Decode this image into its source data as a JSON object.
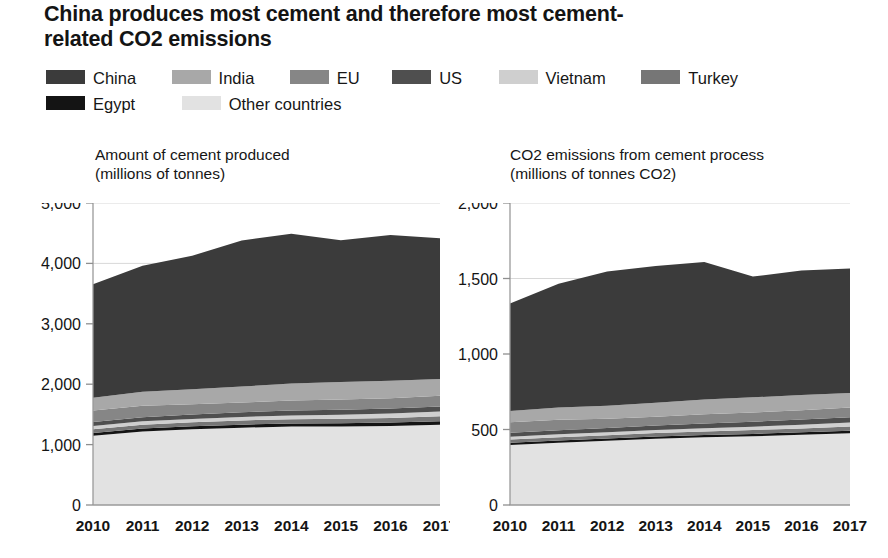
{
  "title": "China produces most cement and therefore most cement-related CO2 emissions",
  "legend": {
    "rows": [
      [
        {
          "label": "China",
          "color": "#3b3b3b"
        },
        {
          "label": "India",
          "color": "#a8a8a8"
        },
        {
          "label": "EU",
          "color": "#868686"
        },
        {
          "label": "US",
          "color": "#4f4f4f"
        },
        {
          "label": "Vietnam",
          "color": "#cfcfcf"
        },
        {
          "label": "Turkey",
          "color": "#767676"
        }
      ],
      [
        {
          "label": "Egypt",
          "color": "#141414"
        },
        {
          "label": "Other countries",
          "color": "#e2e2e2"
        }
      ]
    ]
  },
  "chart_data": [
    {
      "id": "cement-production",
      "type": "area",
      "stacked": true,
      "title": "Amount of cement produced\n(millions of tonnes)",
      "xlabel": "",
      "ylabel": "millions of tonnes",
      "x": [
        "2010",
        "2011",
        "2012",
        "2013",
        "2014",
        "2015",
        "2016",
        "2017"
      ],
      "xlim": [
        2010,
        2017
      ],
      "ylim": [
        0,
        5000
      ],
      "yticks": [
        0,
        1000,
        2000,
        3000,
        4000,
        5000
      ],
      "ytick_labels": [
        "0",
        "1,000",
        "2,000",
        "3,000",
        "4,000",
        "5,000"
      ],
      "grid": true,
      "series": [
        {
          "name": "Other countries",
          "color": "#e2e2e2",
          "values": [
            1145,
            1215,
            1255,
            1280,
            1300,
            1300,
            1310,
            1330
          ]
        },
        {
          "name": "Egypt",
          "color": "#141414",
          "values": [
            48,
            50,
            50,
            50,
            50,
            55,
            55,
            58
          ]
        },
        {
          "name": "Turkey",
          "color": "#767676",
          "values": [
            63,
            64,
            64,
            71,
            71,
            71,
            75,
            80
          ]
        },
        {
          "name": "Vietnam",
          "color": "#cfcfcf",
          "values": [
            51,
            56,
            56,
            58,
            61,
            68,
            73,
            78
          ]
        },
        {
          "name": "US",
          "color": "#4f4f4f",
          "values": [
            66,
            68,
            74,
            77,
            83,
            84,
            86,
            86
          ]
        },
        {
          "name": "EU",
          "color": "#868686",
          "values": [
            191,
            192,
            168,
            160,
            167,
            167,
            170,
            176
          ]
        },
        {
          "name": "India",
          "color": "#a8a8a8",
          "values": [
            210,
            230,
            248,
            265,
            280,
            290,
            290,
            280
          ]
        },
        {
          "name": "China",
          "color": "#3b3b3b",
          "values": [
            1881,
            2085,
            2210,
            2420,
            2480,
            2350,
            2410,
            2330
          ]
        }
      ],
      "totals": [
        3655,
        3960,
        4125,
        4381,
        4492,
        4385,
        4469,
        4418
      ]
    },
    {
      "id": "cement-co2-emissions",
      "type": "area",
      "stacked": true,
      "title": "CO2 emissions from cement process\n(millions of tonnes CO2)",
      "xlabel": "",
      "ylabel": "millions of tonnes CO2",
      "x": [
        "2010",
        "2011",
        "2012",
        "2013",
        "2014",
        "2015",
        "2016",
        "2017"
      ],
      "xlim": [
        2010,
        2017
      ],
      "ylim": [
        0,
        2000
      ],
      "yticks": [
        0,
        500,
        1000,
        1500,
        2000
      ],
      "ytick_labels": [
        "0",
        "500",
        "1,000",
        "1,500",
        "2,000"
      ],
      "grid": true,
      "series": [
        {
          "name": "Other countries",
          "color": "#e2e2e2",
          "values": [
            398,
            412,
            425,
            438,
            448,
            455,
            465,
            475
          ]
        },
        {
          "name": "Egypt",
          "color": "#141414",
          "values": [
            14,
            15,
            15,
            15,
            15,
            16,
            16,
            17
          ]
        },
        {
          "name": "Turkey",
          "color": "#767676",
          "values": [
            22,
            22,
            22,
            24,
            24,
            25,
            26,
            28
          ]
        },
        {
          "name": "Vietnam",
          "color": "#cfcfcf",
          "values": [
            18,
            19,
            19,
            20,
            21,
            23,
            25,
            27
          ]
        },
        {
          "name": "US",
          "color": "#4f4f4f",
          "values": [
            26,
            27,
            29,
            30,
            32,
            33,
            34,
            34
          ]
        },
        {
          "name": "EU",
          "color": "#868686",
          "values": [
            70,
            70,
            62,
            58,
            61,
            61,
            62,
            64
          ]
        },
        {
          "name": "India",
          "color": "#a8a8a8",
          "values": [
            75,
            80,
            86,
            92,
            97,
            100,
            100,
            97
          ]
        },
        {
          "name": "China",
          "color": "#3b3b3b",
          "values": [
            712,
            820,
            888,
            905,
            912,
            800,
            825,
            825
          ]
        }
      ],
      "totals": [
        1335,
        1465,
        1546,
        1582,
        1610,
        1513,
        1553,
        1567
      ]
    }
  ]
}
